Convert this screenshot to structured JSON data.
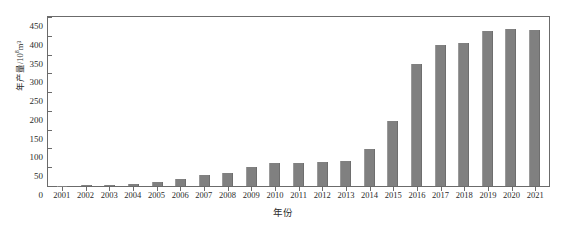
{
  "chart_data": {
    "type": "bar",
    "title": "",
    "xlabel": "年份",
    "ylabel": "年产量/10⁸m³",
    "ylabel_base": "年产量/10",
    "ylabel_exp": "8",
    "ylabel_unit": "m³",
    "categories": [
      "2001",
      "2002",
      "2003",
      "2004",
      "2005",
      "2006",
      "2007",
      "2008",
      "2009",
      "2010",
      "2011",
      "2012",
      "2013",
      "2014",
      "2015",
      "2016",
      "2017",
      "2018",
      "2019",
      "2020",
      "2021"
    ],
    "values": [
      1,
      3,
      4,
      5,
      12,
      19,
      29,
      35,
      50,
      61,
      60,
      65,
      66,
      98,
      172,
      325,
      375,
      382,
      412,
      417,
      415
    ],
    "ylim": [
      0,
      450
    ],
    "yticks": [
      0,
      50,
      100,
      150,
      200,
      250,
      300,
      350,
      400,
      450
    ],
    "ytick_labels": [
      "0",
      "50",
      "100",
      "150",
      "200",
      "250",
      "300",
      "350",
      "400",
      "450"
    ],
    "grid": false,
    "legend": false,
    "bar_color": "#808080",
    "axis_color": "#6b6b6b",
    "background": "#ffffff"
  }
}
